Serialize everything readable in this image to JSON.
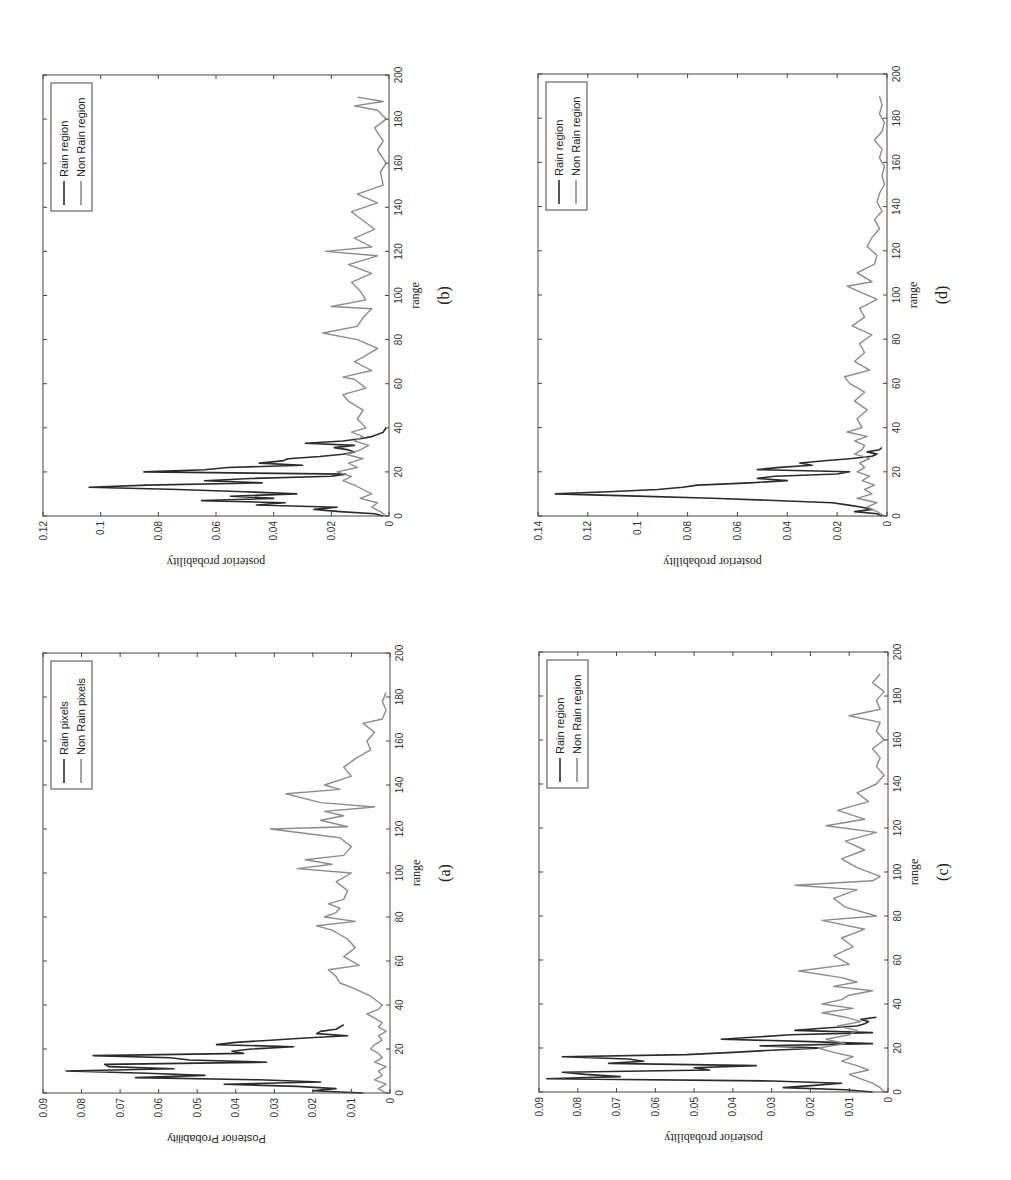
{
  "figure": {
    "background": "#ffffff",
    "colors": {
      "rain": "#2b2b2b",
      "non_rain": "#8c8c8c",
      "axis": "#444444"
    }
  },
  "chart_data": [
    {
      "id": "b",
      "type": "line",
      "caption": "(b)",
      "title": "",
      "xlabel": "range",
      "ylabel": "posterior probability",
      "ylabel_font": "serif",
      "xlim": [
        0,
        200
      ],
      "ylim": [
        0,
        0.12
      ],
      "xticks": [
        0,
        20,
        40,
        60,
        80,
        100,
        120,
        140,
        160,
        180,
        200
      ],
      "yticks": [
        0,
        0.02,
        0.04,
        0.06,
        0.08,
        0.1,
        0.12
      ],
      "ytick_labels": [
        "0",
        "0.02",
        "0.04",
        "0.06",
        "0.08",
        "0.1",
        "0.12"
      ],
      "legend": [
        "Rain region",
        "Non Rain region"
      ],
      "legend_position": "upper right",
      "grid": false,
      "box": {
        "left": 43,
        "top": 75,
        "right": 389,
        "bottom": 516
      },
      "series": [
        {
          "name": "Rain region",
          "x": [
            0,
            1,
            2,
            3,
            4,
            5,
            6,
            7,
            8,
            9,
            10,
            11,
            12,
            13,
            14,
            15,
            16,
            17,
            18,
            19,
            20,
            21,
            22,
            23,
            24,
            25,
            26,
            27,
            28,
            29,
            30,
            31,
            32,
            33,
            34,
            35,
            36,
            37,
            38,
            40
          ],
          "values": [
            0.002,
            0.005,
            0.017,
            0.026,
            0.018,
            0.046,
            0.036,
            0.065,
            0.04,
            0.055,
            0.032,
            0.05,
            0.073,
            0.104,
            0.084,
            0.044,
            0.064,
            0.048,
            0.02,
            0.015,
            0.085,
            0.064,
            0.056,
            0.03,
            0.045,
            0.037,
            0.035,
            0.024,
            0.016,
            0.012,
            0.014,
            0.019,
            0.012,
            0.029,
            0.016,
            0.01,
            0.006,
            0.004,
            0.002,
            0.001
          ]
        },
        {
          "name": "Non Rain region",
          "x": [
            0,
            2,
            4,
            6,
            8,
            10,
            12,
            14,
            16,
            18,
            20,
            22,
            24,
            26,
            28,
            30,
            32,
            34,
            36,
            38,
            40,
            44,
            48,
            52,
            55,
            58,
            62,
            63,
            66,
            70,
            72,
            76,
            80,
            83,
            86,
            90,
            94,
            95,
            98,
            102,
            106,
            110,
            114,
            118,
            120,
            122,
            126,
            130,
            134,
            138,
            142,
            146,
            150,
            156,
            160,
            166,
            170,
            176,
            180,
            184,
            186,
            188,
            190
          ],
          "values": [
            0.001,
            0.003,
            0.006,
            0.004,
            0.01,
            0.006,
            0.009,
            0.012,
            0.016,
            0.013,
            0.018,
            0.011,
            0.014,
            0.009,
            0.015,
            0.01,
            0.007,
            0.012,
            0.009,
            0.013,
            0.008,
            0.011,
            0.009,
            0.014,
            0.016,
            0.008,
            0.012,
            0.016,
            0.006,
            0.012,
            0.009,
            0.004,
            0.011,
            0.023,
            0.011,
            0.009,
            0.006,
            0.02,
            0.008,
            0.01,
            0.013,
            0.006,
            0.014,
            0.004,
            0.022,
            0.006,
            0.012,
            0.005,
            0.009,
            0.013,
            0.004,
            0.011,
            0.002,
            0.003,
            0.001,
            0.004,
            0.002,
            0.005,
            0.001,
            0.004,
            0.012,
            0.002,
            0.011
          ]
        }
      ]
    },
    {
      "id": "d",
      "type": "line",
      "caption": "(d)",
      "title": "",
      "xlabel": "range",
      "ylabel": "posterior probability",
      "ylabel_font": "serif",
      "xlim": [
        0,
        200
      ],
      "ylim": [
        0,
        0.14
      ],
      "xticks": [
        0,
        20,
        40,
        60,
        80,
        100,
        120,
        140,
        160,
        180,
        200
      ],
      "yticks": [
        0,
        0.02,
        0.04,
        0.06,
        0.08,
        0.1,
        0.12,
        0.14
      ],
      "ytick_labels": [
        "0",
        "0.02",
        "0.04",
        "0.06",
        "0.08",
        "0.1",
        "0.12",
        "0.14"
      ],
      "legend": [
        "Rain region",
        "Non Rain region"
      ],
      "legend_position": "upper right",
      "grid": false,
      "box": {
        "left": 538,
        "top": 74,
        "right": 887,
        "bottom": 516
      },
      "series": [
        {
          "name": "Rain region",
          "x": [
            0,
            1,
            2,
            3,
            4,
            5,
            6,
            7,
            8,
            9,
            10,
            11,
            12,
            13,
            14,
            15,
            16,
            17,
            18,
            19,
            20,
            21,
            22,
            23,
            24,
            25,
            26,
            27,
            28,
            29,
            30,
            31
          ],
          "values": [
            0.002,
            0.004,
            0.013,
            0.006,
            0.01,
            0.016,
            0.022,
            0.045,
            0.07,
            0.1,
            0.133,
            0.112,
            0.092,
            0.082,
            0.076,
            0.055,
            0.04,
            0.052,
            0.045,
            0.02,
            0.015,
            0.052,
            0.043,
            0.03,
            0.035,
            0.025,
            0.014,
            0.006,
            0.004,
            0.008,
            0.003,
            0.002
          ]
        },
        {
          "name": "Non Rain region",
          "x": [
            0,
            2,
            4,
            6,
            8,
            10,
            12,
            14,
            16,
            18,
            20,
            22,
            24,
            26,
            28,
            30,
            32,
            34,
            36,
            38,
            40,
            44,
            48,
            52,
            56,
            60,
            63,
            66,
            70,
            74,
            78,
            82,
            86,
            90,
            94,
            98,
            102,
            104,
            106,
            110,
            114,
            118,
            122,
            126,
            130,
            134,
            138,
            142,
            146,
            150,
            154,
            158,
            162,
            166,
            170,
            174,
            178,
            182,
            186,
            190
          ],
          "values": [
            0.001,
            0.004,
            0.008,
            0.004,
            0.012,
            0.006,
            0.009,
            0.005,
            0.01,
            0.007,
            0.012,
            0.009,
            0.011,
            0.007,
            0.013,
            0.01,
            0.009,
            0.013,
            0.008,
            0.016,
            0.01,
            0.012,
            0.008,
            0.013,
            0.009,
            0.015,
            0.017,
            0.007,
            0.013,
            0.009,
            0.011,
            0.006,
            0.014,
            0.009,
            0.011,
            0.004,
            0.012,
            0.016,
            0.006,
            0.012,
            0.005,
            0.004,
            0.008,
            0.006,
            0.003,
            0.005,
            0.002,
            0.004,
            0.003,
            0.001,
            0.002,
            0.001,
            0.003,
            0.002,
            0.005,
            0.002,
            0.001,
            0.003,
            0.002,
            0.003
          ]
        }
      ]
    },
    {
      "id": "a",
      "type": "line",
      "caption": "(a)",
      "title": "",
      "xlabel": "range",
      "ylabel": "Posterior Probability",
      "ylabel_font": "sans",
      "xlim": [
        0,
        200
      ],
      "ylim": [
        0,
        0.09
      ],
      "xticks": [
        0,
        20,
        40,
        60,
        80,
        100,
        120,
        140,
        160,
        180,
        200
      ],
      "yticks": [
        0,
        0.01,
        0.02,
        0.03,
        0.04,
        0.05,
        0.06,
        0.07,
        0.08,
        0.09
      ],
      "ytick_labels": [
        "0",
        "0.01",
        "0.02",
        "0.03",
        "0.04",
        "0.05",
        "0.06",
        "0.07",
        "0.08",
        "0.09"
      ],
      "legend": [
        "Rain pixels",
        "Non Rain pixels"
      ],
      "legend_position": "upper right",
      "grid": false,
      "box": {
        "left": 43,
        "top": 653,
        "right": 390,
        "bottom": 1093
      },
      "series": [
        {
          "name": "Rain pixels",
          "x": [
            0,
            1,
            2,
            3,
            4,
            5,
            6,
            7,
            8,
            9,
            10,
            11,
            12,
            13,
            14,
            15,
            16,
            17,
            18,
            19,
            20,
            21,
            22,
            23,
            24,
            25,
            26,
            27,
            28,
            29,
            30,
            31
          ],
          "values": [
            0.007,
            0.02,
            0.014,
            0.024,
            0.043,
            0.018,
            0.034,
            0.066,
            0.048,
            0.063,
            0.084,
            0.056,
            0.073,
            0.074,
            0.032,
            0.052,
            0.057,
            0.077,
            0.038,
            0.041,
            0.036,
            0.025,
            0.045,
            0.04,
            0.031,
            0.022,
            0.011,
            0.019,
            0.018,
            0.014,
            0.013,
            0.012
          ]
        },
        {
          "name": "Non Rain pixels",
          "x": [
            0,
            2,
            4,
            6,
            8,
            10,
            12,
            14,
            16,
            18,
            20,
            22,
            24,
            26,
            28,
            30,
            32,
            34,
            36,
            38,
            40,
            44,
            48,
            50,
            53,
            56,
            58,
            62,
            66,
            70,
            74,
            76,
            78,
            80,
            82,
            84,
            86,
            88,
            92,
            96,
            100,
            102,
            104,
            106,
            108,
            112,
            116,
            120,
            121,
            124,
            126,
            128,
            130,
            132,
            136,
            138,
            140,
            144,
            148,
            152,
            156,
            160,
            164,
            168,
            170,
            174,
            178,
            182
          ],
          "values": [
            0.001,
            0.003,
            0.001,
            0.004,
            0.002,
            0.003,
            0.001,
            0.004,
            0.002,
            0.003,
            0.005,
            0.004,
            0.002,
            0.003,
            0.001,
            0.003,
            0.002,
            0.004,
            0.006,
            0.003,
            0.002,
            0.005,
            0.01,
            0.013,
            0.014,
            0.016,
            0.008,
            0.012,
            0.009,
            0.011,
            0.015,
            0.019,
            0.009,
            0.017,
            0.014,
            0.013,
            0.016,
            0.012,
            0.011,
            0.014,
            0.01,
            0.024,
            0.015,
            0.022,
            0.012,
            0.01,
            0.013,
            0.031,
            0.011,
            0.018,
            0.012,
            0.017,
            0.004,
            0.018,
            0.027,
            0.013,
            0.017,
            0.01,
            0.012,
            0.009,
            0.005,
            0.006,
            0.004,
            0.007,
            0.002,
            0.001,
            0.002,
            0.001
          ]
        }
      ]
    },
    {
      "id": "c",
      "type": "line",
      "caption": "(c)",
      "title": "",
      "xlabel": "range",
      "ylabel": "posterior probability",
      "ylabel_font": "serif",
      "xlim": [
        0,
        200
      ],
      "ylim": [
        0,
        0.09
      ],
      "xticks": [
        0,
        20,
        40,
        60,
        80,
        100,
        120,
        140,
        160,
        180,
        200
      ],
      "yticks": [
        0,
        0.01,
        0.02,
        0.03,
        0.04,
        0.05,
        0.06,
        0.07,
        0.08,
        0.09
      ],
      "ytick_labels": [
        "0",
        "0.01",
        "0.02",
        "0.03",
        "0.04",
        "0.05",
        "0.06",
        "0.07",
        "0.08",
        "0.09"
      ],
      "legend": [
        "Rain region",
        "Non Rain region"
      ],
      "legend_position": "upper right",
      "grid": false,
      "box": {
        "left": 539,
        "top": 652,
        "right": 888,
        "bottom": 1092
      },
      "series": [
        {
          "name": "Rain region",
          "x": [
            0,
            1,
            2,
            3,
            4,
            5,
            6,
            7,
            8,
            9,
            10,
            11,
            12,
            13,
            14,
            15,
            16,
            17,
            18,
            19,
            20,
            21,
            22,
            23,
            24,
            25,
            26,
            27,
            28,
            29,
            30,
            31,
            32,
            33,
            34
          ],
          "values": [
            0.004,
            0.011,
            0.027,
            0.019,
            0.012,
            0.03,
            0.088,
            0.069,
            0.078,
            0.084,
            0.046,
            0.05,
            0.034,
            0.072,
            0.063,
            0.067,
            0.084,
            0.052,
            0.04,
            0.03,
            0.017,
            0.033,
            0.004,
            0.022,
            0.043,
            0.034,
            0.025,
            0.004,
            0.024,
            0.017,
            0.008,
            0.006,
            0.005,
            0.007,
            0.003
          ]
        },
        {
          "name": "Non Rain region",
          "x": [
            0,
            2,
            4,
            6,
            8,
            10,
            12,
            14,
            16,
            18,
            20,
            22,
            24,
            26,
            28,
            30,
            32,
            34,
            36,
            38,
            40,
            42,
            44,
            46,
            48,
            50,
            52,
            55,
            58,
            62,
            66,
            70,
            74,
            78,
            80,
            84,
            88,
            92,
            94,
            96,
            98,
            102,
            106,
            110,
            114,
            118,
            121,
            124,
            128,
            132,
            136,
            140,
            144,
            148,
            152,
            156,
            160,
            164,
            168,
            171,
            174,
            178,
            182,
            186,
            190
          ],
          "values": [
            0.001,
            0.002,
            0.004,
            0.007,
            0.01,
            0.005,
            0.008,
            0.012,
            0.009,
            0.014,
            0.018,
            0.011,
            0.016,
            0.01,
            0.008,
            0.013,
            0.007,
            0.011,
            0.017,
            0.009,
            0.017,
            0.012,
            0.01,
            0.004,
            0.014,
            0.008,
            0.012,
            0.023,
            0.01,
            0.014,
            0.009,
            0.012,
            0.006,
            0.017,
            0.003,
            0.011,
            0.014,
            0.008,
            0.024,
            0.004,
            0.002,
            0.008,
            0.012,
            0.006,
            0.011,
            0.003,
            0.016,
            0.006,
            0.013,
            0.005,
            0.008,
            0.003,
            0.001,
            0.003,
            0.002,
            0.004,
            0.001,
            0.003,
            0.002,
            0.01,
            0.002,
            0.003,
            0.001,
            0.004,
            0.002
          ]
        }
      ]
    }
  ]
}
